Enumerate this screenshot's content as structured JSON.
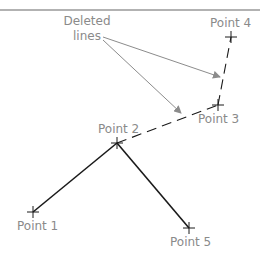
{
  "colors": {
    "solid_line": "#1a1a1a",
    "dashed_line": "#1a1a1a",
    "arrow": "#8c8c8c",
    "label": "#8a8a8a",
    "frame": "#999999"
  },
  "annotation": {
    "line1": "Deleted",
    "line2": "lines"
  },
  "points": [
    {
      "id": "p1",
      "label": "Point 1",
      "x": 33,
      "y": 212
    },
    {
      "id": "p2",
      "label": "Point 2",
      "x": 117,
      "y": 143
    },
    {
      "id": "p3",
      "label": "Point 3",
      "x": 218,
      "y": 105
    },
    {
      "id": "p4",
      "label": "Point 4",
      "x": 231,
      "y": 37
    },
    {
      "id": "p5",
      "label": "Point 5",
      "x": 189,
      "y": 228
    }
  ],
  "segments": {
    "solid": [
      [
        "Point 1",
        "Point 2"
      ],
      [
        "Point 2",
        "Point 5"
      ]
    ],
    "deleted_dashed": [
      [
        "Point 2",
        "Point 3"
      ],
      [
        "Point 3",
        "Point 4"
      ]
    ]
  }
}
